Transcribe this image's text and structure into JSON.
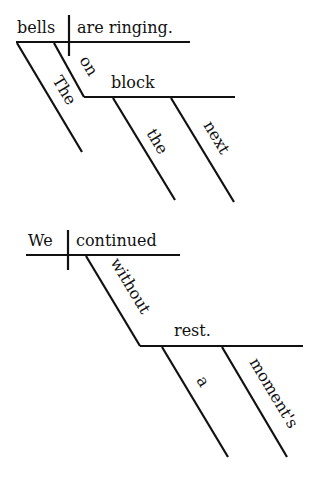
{
  "diagrams": [
    {
      "sentence": "The bells on the next block are ringing.",
      "subject": "bells",
      "predicate": "are ringing.",
      "modifiers": {
        "subject_article": "The",
        "preposition": "on",
        "object": "block",
        "object_article": "the",
        "object_adjective": "next"
      }
    },
    {
      "sentence": "We continued without a moment's rest.",
      "subject": "We",
      "predicate": "continued",
      "modifiers": {
        "preposition": "without",
        "object": "rest.",
        "object_article": "a",
        "object_possessive": "moment's"
      }
    }
  ],
  "colors": {
    "ink": "#111111",
    "background": "#ffffff"
  }
}
